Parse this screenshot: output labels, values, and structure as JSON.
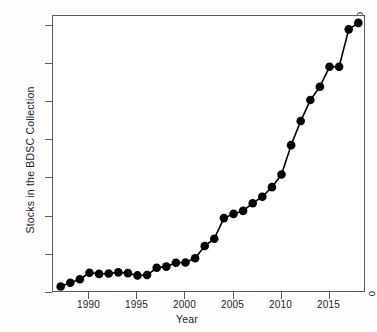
{
  "chart_data": {
    "type": "line",
    "title": "",
    "subtitle": "",
    "xlabel": "Year",
    "ylabel": "Stocks in the BDSC Collection",
    "xlim": [
      1986.2,
      1986.2
    ],
    "ylim": [
      0,
      72500
    ],
    "grid": false,
    "legend": null,
    "marker": "filled-circle",
    "line_color": "#000000",
    "marker_color": "#000000",
    "x_ticks": [
      1990,
      1995,
      2000,
      2005,
      2010,
      2015
    ],
    "x_tick_labels": [
      "1990",
      "1995",
      "2000",
      "2005",
      "2010",
      "2015"
    ],
    "y_ticks": [
      0,
      10000,
      20000,
      30000,
      40000,
      50000,
      60000,
      70000
    ],
    "y_tick_labels": [
      "0",
      "10,000",
      "20,000",
      "30,000",
      "40,000",
      "50,000",
      "60,000",
      "70,000"
    ],
    "x": [
      1987,
      1988,
      1989,
      1990,
      1991,
      1992,
      1993,
      1994,
      1995,
      1996,
      1997,
      1998,
      1999,
      2000,
      2001,
      2002,
      2003,
      2004,
      2005,
      2006,
      2007,
      2008,
      2009,
      2010,
      2011,
      2012,
      2013,
      2014,
      2015,
      2016,
      2017,
      2018
    ],
    "values": [
      1700,
      2700,
      3600,
      5300,
      5000,
      5100,
      5400,
      5200,
      4600,
      4700,
      6600,
      6900,
      7900,
      8000,
      9100,
      12300,
      14200,
      19600,
      20700,
      21500,
      23500,
      25200,
      27700,
      31000,
      38700,
      45000,
      50500,
      54000,
      59200,
      59200,
      69000,
      70700
    ],
    "series": [
      {
        "name": "BDSC stock count",
        "values": [
          1700,
          2700,
          3600,
          5300,
          5000,
          5100,
          5400,
          5200,
          4600,
          4700,
          6600,
          6900,
          7900,
          8000,
          9100,
          12300,
          14200,
          19600,
          20700,
          21500,
          23500,
          25200,
          27700,
          31000,
          38700,
          45000,
          50500,
          54000,
          59200,
          59200,
          69000,
          70700
        ]
      }
    ]
  }
}
